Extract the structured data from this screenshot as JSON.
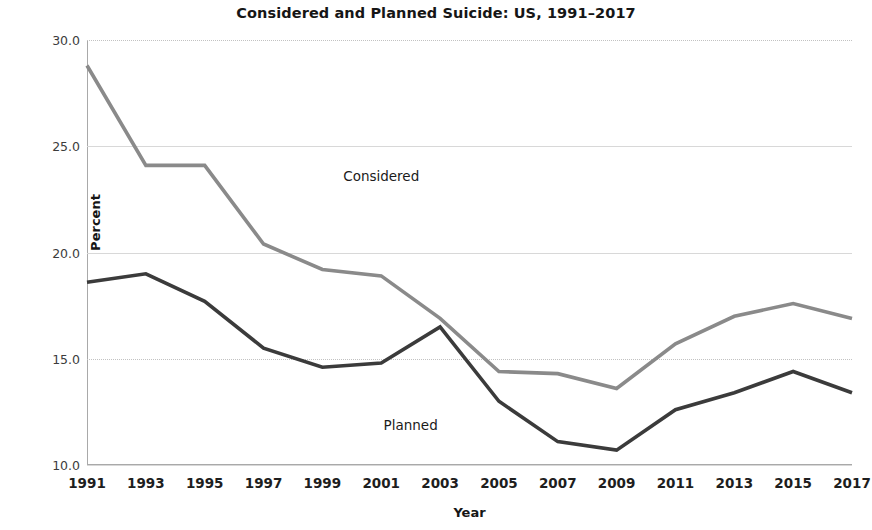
{
  "chart_data": {
    "type": "line",
    "title": "Considered and Planned Suicide: US, 1991–2017",
    "xlabel": "Year",
    "ylabel": "Percent",
    "grid": true,
    "legend_position": "inline-annotations",
    "x": [
      1991,
      1993,
      1995,
      1997,
      1999,
      2001,
      2003,
      2005,
      2007,
      2009,
      2011,
      2013,
      2015,
      2017
    ],
    "categories": [
      "1991",
      "1993",
      "1995",
      "1997",
      "1999",
      "2001",
      "2003",
      "2005",
      "2007",
      "2009",
      "2011",
      "2013",
      "2015",
      "2017"
    ],
    "xlim": [
      1991,
      2017
    ],
    "ylim": [
      10.0,
      30.0
    ],
    "yticks": [
      "30.0",
      "25.0",
      "20.0",
      "15.0",
      "10.0"
    ],
    "ytick_values": [
      30.0,
      25.0,
      20.0,
      15.0,
      10.0
    ],
    "series": [
      {
        "name": "Considered",
        "color": "#8a8a8a",
        "values": [
          28.8,
          24.1,
          24.1,
          20.4,
          19.2,
          18.9,
          16.9,
          14.4,
          14.3,
          13.6,
          15.7,
          17.0,
          17.6,
          16.9
        ],
        "annotation": "Considered",
        "annotation_x": 2001,
        "annotation_y": 23.6
      },
      {
        "name": "Planned",
        "color": "#3b3b3b",
        "values": [
          18.6,
          19.0,
          17.7,
          15.5,
          14.6,
          14.8,
          16.5,
          13.0,
          11.1,
          10.7,
          12.6,
          13.4,
          14.4,
          13.4
        ],
        "annotation": "Planned",
        "annotation_x": 2002,
        "annotation_y": 11.9
      }
    ]
  }
}
